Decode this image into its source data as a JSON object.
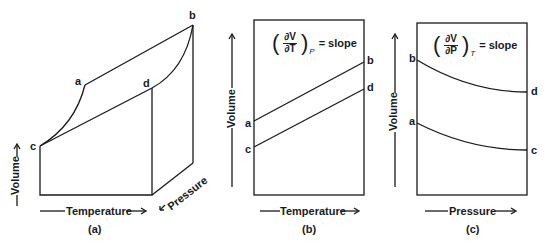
{
  "panels": {
    "a": {
      "caption": "(a)",
      "points": {
        "a": "a",
        "b": "b",
        "c": "c",
        "d": "d"
      },
      "axes": {
        "volume": "Volume",
        "temperature": "Temperature",
        "pressure": "Pressure"
      }
    },
    "b": {
      "caption": "(b)",
      "formula": {
        "numerator": "∂V",
        "denominator": "∂T",
        "subscript": "P",
        "equals": "= slope"
      },
      "points": {
        "a": "a",
        "b": "b",
        "c": "c",
        "d": "d"
      },
      "axes": {
        "y": "Volume",
        "x": "Temperature"
      }
    },
    "c": {
      "caption": "(c)",
      "formula": {
        "numerator": "∂V",
        "denominator": "∂P",
        "subscript": "T",
        "equals": "= slope"
      },
      "points": {
        "a": "a",
        "b": "b",
        "c": "c",
        "d": "d"
      },
      "axes": {
        "y": "Volume",
        "x": "Pressure"
      }
    }
  },
  "colors": {
    "line": "#1a1a1a",
    "background": "#ffffff"
  }
}
